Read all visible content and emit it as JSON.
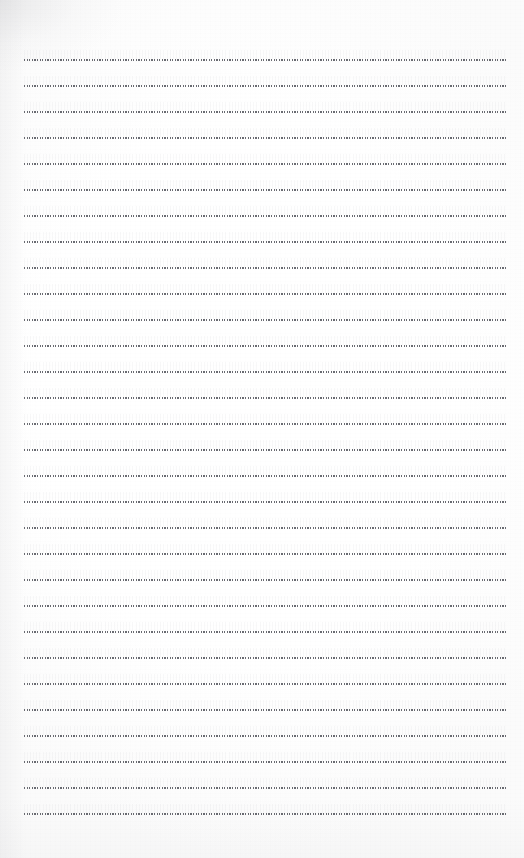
{
  "page": {
    "kind": "lined-paper-scan",
    "width": 524,
    "height": 858,
    "background_color": "#ffffff",
    "paper_tint": "#fdfdfd",
    "content_text": "",
    "written_text": "",
    "title": ""
  },
  "ruling": {
    "style": "dotted",
    "line_color": "#484a52",
    "line_count": 30,
    "first_line_y": 59,
    "line_spacing": 26,
    "line_thickness": 1,
    "left_margin_x": 24,
    "right_margin_x": 508,
    "line_width": 484,
    "lines": [
      {
        "index": 1,
        "y": 59
      },
      {
        "index": 2,
        "y": 85
      },
      {
        "index": 3,
        "y": 111
      },
      {
        "index": 4,
        "y": 137
      },
      {
        "index": 5,
        "y": 163
      },
      {
        "index": 6,
        "y": 189
      },
      {
        "index": 7,
        "y": 215
      },
      {
        "index": 8,
        "y": 241
      },
      {
        "index": 9,
        "y": 267
      },
      {
        "index": 10,
        "y": 293
      },
      {
        "index": 11,
        "y": 319
      },
      {
        "index": 12,
        "y": 345
      },
      {
        "index": 13,
        "y": 371
      },
      {
        "index": 14,
        "y": 397
      },
      {
        "index": 15,
        "y": 423
      },
      {
        "index": 16,
        "y": 449
      },
      {
        "index": 17,
        "y": 475
      },
      {
        "index": 18,
        "y": 501
      },
      {
        "index": 19,
        "y": 527
      },
      {
        "index": 20,
        "y": 553
      },
      {
        "index": 21,
        "y": 579
      },
      {
        "index": 22,
        "y": 605
      },
      {
        "index": 23,
        "y": 631
      },
      {
        "index": 24,
        "y": 657
      },
      {
        "index": 25,
        "y": 683
      },
      {
        "index": 26,
        "y": 709
      },
      {
        "index": 27,
        "y": 735
      },
      {
        "index": 28,
        "y": 761
      },
      {
        "index": 29,
        "y": 787
      },
      {
        "index": 30,
        "y": 813
      }
    ]
  },
  "margins": {
    "top": 59,
    "bottom": 45,
    "left": 24,
    "right": 16
  }
}
